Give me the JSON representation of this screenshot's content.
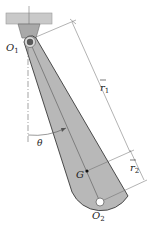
{
  "figure": {
    "type": "compound pendulum diagram",
    "labels": {
      "pivot_top": "O",
      "pivot_top_sub": "1",
      "pivot_bottom": "O",
      "pivot_bottom_sub": "2",
      "center_of_mass": "G",
      "angle": "θ",
      "r1": "r",
      "r1_sub": "1",
      "r2": "r",
      "r2_sub": "2"
    },
    "colors": {
      "link_fill": "#b8b8b8",
      "link_stroke": "#3a3a3a",
      "ceiling_fill": "#c9c9c9",
      "line": "#555555",
      "background": "#ffffff"
    }
  }
}
